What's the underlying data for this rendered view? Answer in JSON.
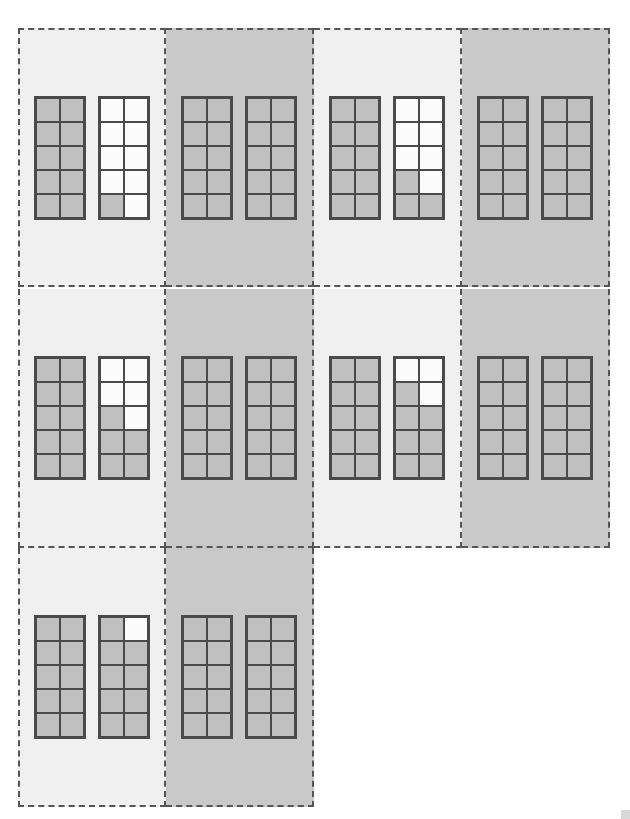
{
  "figure": {
    "canvas": {
      "width": 630,
      "height": 819,
      "background": "#ffffff"
    },
    "block_spec": {
      "columns": 2,
      "rows": 5,
      "total_cells": 10,
      "cell_size_px": 24,
      "grid_line_color": "#4a4a4a",
      "filled_color": "#c0c0c0",
      "empty_color": "#fbfbfb"
    },
    "panel_spec": {
      "border_style": "dashed",
      "border_color": "#555555",
      "blocks_per_panel": 2,
      "background_light": "#f0f0f0",
      "background_dark": "#c9c9c9",
      "width_px": 148,
      "height_px": 259
    }
  },
  "chart_data": {
    "type": "table",
    "xlabel": "",
    "ylabel": "",
    "grid": true,
    "legend": "",
    "panel_columns": 4,
    "panel_rows": 3,
    "cells_per_block": 10,
    "filled_total": 193,
    "categories": [
      "panel-r1c1",
      "panel-r1c2",
      "panel-r1c3",
      "panel-r1c4",
      "panel-r2c1",
      "panel-r2c2",
      "panel-r2c3",
      "panel-r2c4",
      "panel-r3c1",
      "panel-r3c2"
    ],
    "values": [
      11,
      20,
      13,
      20,
      16,
      20,
      18,
      20,
      19,
      20
    ]
  },
  "rows": [
    {
      "row_index": 1,
      "top_px": 28,
      "panels": [
        {
          "id": "panel-r1c1",
          "shade": "light",
          "filled_count": 11,
          "blocks": [
            {
              "id": "block-a",
              "filled": 10,
              "cells": [
                1,
                1,
                1,
                1,
                1,
                1,
                1,
                1,
                1,
                1
              ]
            },
            {
              "id": "block-b",
              "filled": 1,
              "cells": [
                0,
                0,
                0,
                0,
                0,
                0,
                0,
                0,
                1,
                0
              ]
            }
          ]
        },
        {
          "id": "panel-r1c2",
          "shade": "dark",
          "filled_count": 20,
          "blocks": [
            {
              "id": "block-a",
              "filled": 10,
              "cells": [
                1,
                1,
                1,
                1,
                1,
                1,
                1,
                1,
                1,
                1
              ]
            },
            {
              "id": "block-b",
              "filled": 10,
              "cells": [
                1,
                1,
                1,
                1,
                1,
                1,
                1,
                1,
                1,
                1
              ]
            }
          ]
        },
        {
          "id": "panel-r1c3",
          "shade": "light",
          "filled_count": 13,
          "blocks": [
            {
              "id": "block-a",
              "filled": 10,
              "cells": [
                1,
                1,
                1,
                1,
                1,
                1,
                1,
                1,
                1,
                1
              ]
            },
            {
              "id": "block-b",
              "filled": 3,
              "cells": [
                0,
                0,
                0,
                0,
                0,
                0,
                1,
                0,
                1,
                1
              ]
            }
          ]
        },
        {
          "id": "panel-r1c4",
          "shade": "dark",
          "filled_count": 20,
          "blocks": [
            {
              "id": "block-a",
              "filled": 10,
              "cells": [
                1,
                1,
                1,
                1,
                1,
                1,
                1,
                1,
                1,
                1
              ]
            },
            {
              "id": "block-b",
              "filled": 10,
              "cells": [
                1,
                1,
                1,
                1,
                1,
                1,
                1,
                1,
                1,
                1
              ]
            }
          ]
        }
      ]
    },
    {
      "row_index": 2,
      "top_px": 289,
      "panels": [
        {
          "id": "panel-r2c1",
          "shade": "light",
          "filled_count": 16,
          "blocks": [
            {
              "id": "block-a",
              "filled": 10,
              "cells": [
                1,
                1,
                1,
                1,
                1,
                1,
                1,
                1,
                1,
                1
              ]
            },
            {
              "id": "block-b",
              "filled": 6,
              "cells": [
                0,
                0,
                0,
                0,
                1,
                0,
                1,
                1,
                1,
                1
              ]
            }
          ]
        },
        {
          "id": "panel-r2c2",
          "shade": "dark",
          "filled_count": 20,
          "blocks": [
            {
              "id": "block-a",
              "filled": 10,
              "cells": [
                1,
                1,
                1,
                1,
                1,
                1,
                1,
                1,
                1,
                1
              ]
            },
            {
              "id": "block-b",
              "filled": 10,
              "cells": [
                1,
                1,
                1,
                1,
                1,
                1,
                1,
                1,
                1,
                1
              ]
            }
          ]
        },
        {
          "id": "panel-r2c3",
          "shade": "light",
          "filled_count": 18,
          "blocks": [
            {
              "id": "block-a",
              "filled": 10,
              "cells": [
                1,
                1,
                1,
                1,
                1,
                1,
                1,
                1,
                1,
                1
              ]
            },
            {
              "id": "block-b",
              "filled": 8,
              "cells": [
                0,
                0,
                1,
                0,
                1,
                1,
                1,
                1,
                1,
                1
              ]
            }
          ]
        },
        {
          "id": "panel-r2c4",
          "shade": "dark",
          "filled_count": 20,
          "blocks": [
            {
              "id": "block-a",
              "filled": 10,
              "cells": [
                1,
                1,
                1,
                1,
                1,
                1,
                1,
                1,
                1,
                1
              ]
            },
            {
              "id": "block-b",
              "filled": 10,
              "cells": [
                1,
                1,
                1,
                1,
                1,
                1,
                1,
                1,
                1,
                1
              ]
            }
          ]
        }
      ]
    },
    {
      "row_index": 3,
      "top_px": 548,
      "panels": [
        {
          "id": "panel-r3c1",
          "shade": "light",
          "filled_count": 19,
          "blocks": [
            {
              "id": "block-a",
              "filled": 10,
              "cells": [
                1,
                1,
                1,
                1,
                1,
                1,
                1,
                1,
                1,
                1
              ]
            },
            {
              "id": "block-b",
              "filled": 9,
              "cells": [
                1,
                0,
                1,
                1,
                1,
                1,
                1,
                1,
                1,
                1
              ]
            }
          ]
        },
        {
          "id": "panel-r3c2",
          "shade": "dark",
          "filled_count": 20,
          "blocks": [
            {
              "id": "block-a",
              "filled": 10,
              "cells": [
                1,
                1,
                1,
                1,
                1,
                1,
                1,
                1,
                1,
                1
              ]
            },
            {
              "id": "block-b",
              "filled": 10,
              "cells": [
                1,
                1,
                1,
                1,
                1,
                1,
                1,
                1,
                1,
                1
              ]
            }
          ]
        }
      ]
    }
  ]
}
